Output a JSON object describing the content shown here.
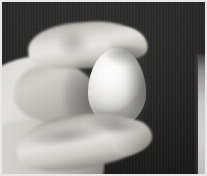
{
  "image": {
    "kind": "photograph",
    "title": "Hand holding a white egg",
    "orientation": "landscape",
    "width_px": 207,
    "height_px": 176,
    "color_mode": "near-greyscale / desaturated colour",
    "caption": ""
  },
  "scene": {
    "subject": "A human hand grasping a single white chicken egg between the index finger and the thumb",
    "lighting": "Single soft key light from the upper left; strong falloff to the right",
    "background_description": "Flat dark near-black studio backdrop with faint vertical fabric streaking",
    "framing": "Close-up, hand enters from the lower-left corner, egg centred slightly right of middle"
  },
  "objects": [
    {
      "name": "egg",
      "label": "White egg",
      "description": "Smooth ovoid egg, bright white with a specular highlight on its upper-left face and soft grey shading down its right side",
      "dominant_color": "#f4f3f0",
      "highlight_color": "#ffffff",
      "shadow_color": "#b0ada8",
      "bbox": {
        "x": 86,
        "y": 46,
        "w": 58,
        "h": 78
      }
    },
    {
      "name": "index-finger",
      "label": "Index finger",
      "description": "Index finger curled over the top of the egg, its fingertip pressing down on the egg's upper right",
      "dominant_color": "#ddd9d4",
      "bbox": {
        "x": 26,
        "y": 20,
        "w": 120,
        "h": 46
      }
    },
    {
      "name": "thumb",
      "label": "Thumb",
      "description": "Thumb extending from the lower left, supporting the underside of the egg with its tip",
      "dominant_color": "#d9d6d0",
      "bbox": {
        "x": 14,
        "y": 112,
        "w": 136,
        "h": 54
      }
    },
    {
      "name": "palm",
      "label": "Palm and wrist",
      "description": "Soft out-of-focus mass of the palm and wrist filling the left and lower-left of the frame",
      "dominant_color": "#cbc7c1",
      "bbox": {
        "x": 0,
        "y": 54,
        "w": 104,
        "h": 122
      }
    },
    {
      "name": "background-backdrop",
      "label": "Dark backdrop",
      "description": "Very dark, nearly black backdrop occupying the upper and right portion of the frame",
      "dominant_color": "#232220",
      "bbox": {
        "x": 0,
        "y": 0,
        "w": 203,
        "h": 172
      }
    },
    {
      "name": "right-light-strip",
      "label": "Light strip at right margin",
      "description": "Narrow blurred pale-grey vertical band along the right edge of the photograph, lower two-thirds only",
      "dominant_color": "#cdcdca",
      "bbox": {
        "x": 196,
        "y": 54,
        "w": 9,
        "h": 120
      }
    }
  ],
  "palette": {
    "background_dark": "#232220",
    "background_dark_top": "#2c2b29",
    "background_dark_bottom": "#1b1a19",
    "egg_white": "#ffffff",
    "egg_midtone": "#f2f1ee",
    "egg_shadow": "#b0ada8",
    "skin_light": "#e9e6e1",
    "skin_mid": "#cfcbc4",
    "skin_shadow": "#7e7a74",
    "right_strip": "#cdcdca",
    "frame_border": "#e8e8e6"
  }
}
